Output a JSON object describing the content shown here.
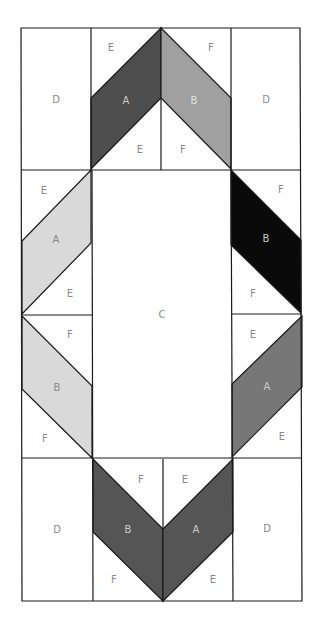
{
  "diagram": {
    "type": "quilt-block-pattern",
    "colors": {
      "background": "#ffffff",
      "line": "#1a1a1a",
      "label": "#8a8a8a",
      "top_a": "#4d4d4d",
      "top_b": "#a0a0a0",
      "left_a": "#d9d9d9",
      "left_b": "#d9d9d9",
      "right_b": "#0a0a0a",
      "right_a": "#777777",
      "bottom_b": "#555555",
      "bottom_a": "#555555"
    },
    "labels": {
      "d_top_left": "D",
      "d_top_right": "D",
      "d_bottom_left": "D",
      "d_bottom_right": "D",
      "c_center": "C",
      "top_e_outer": "E",
      "top_f_outer": "F",
      "top_a": "A",
      "top_b": "B",
      "top_e_inner": "E",
      "top_f_inner": "F",
      "left_upper_e_top": "E",
      "left_upper_a": "A",
      "left_upper_e_bottom": "E",
      "left_lower_f_top": "F",
      "left_lower_b": "B",
      "left_lower_f_bottom": "F",
      "right_upper_f_top": "F",
      "right_upper_b": "B",
      "right_upper_f_bottom": "F",
      "right_lower_e_top": "E",
      "right_lower_a": "A",
      "right_lower_e_bottom": "E",
      "bottom_f_inner": "F",
      "bottom_e_inner": "E",
      "bottom_b": "B",
      "bottom_a": "A",
      "bottom_f_outer": "F",
      "bottom_e_outer": "E"
    }
  }
}
